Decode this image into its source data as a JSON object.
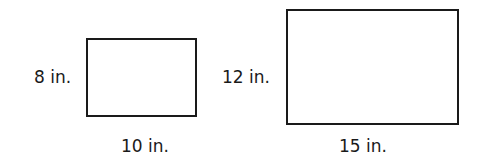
{
  "figures": [
    {
      "name": "small-rectangle",
      "height_label": "8 in.",
      "width_label": "10 in."
    },
    {
      "name": "large-rectangle",
      "height_label": "12 in.",
      "width_label": "15 in."
    }
  ]
}
